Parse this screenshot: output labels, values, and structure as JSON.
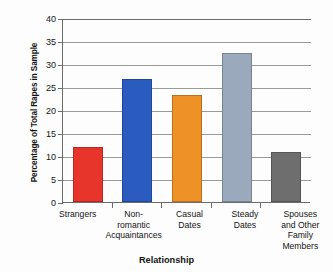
{
  "chart_data": {
    "type": "bar",
    "title": "",
    "xlabel": "Relationship",
    "ylabel": "Percentage of Total Rapes in Sample",
    "categories": [
      "Strangers",
      "Non-romantic Acquaintances",
      "Casual Dates",
      "Steady Dates",
      "Spouses and Other Family Members"
    ],
    "category_lines": [
      [
        "Strangers"
      ],
      [
        "Non-",
        "romantic",
        "Acquaintances"
      ],
      [
        "Casual",
        "Dates"
      ],
      [
        "Steady",
        "Dates"
      ],
      [
        "Spouses",
        "and Other",
        "Family",
        "Members"
      ]
    ],
    "values": [
      12.0,
      26.7,
      23.3,
      32.5,
      10.8
    ],
    "colors": [
      "#e8352c",
      "#2a5cbf",
      "#ee9126",
      "#9ba9bc",
      "#6e6e6e"
    ],
    "ylim": [
      0,
      40
    ],
    "yticks": [
      0,
      5,
      10,
      15,
      20,
      25,
      30,
      35,
      40
    ],
    "ytick_labels": [
      "0",
      "5",
      "10",
      "15",
      "20",
      "25",
      "30",
      "35",
      "40"
    ],
    "grid": true,
    "legend": "none"
  },
  "axis": {
    "y_title": "Percentage of Total Rapes in Sample",
    "x_title": "Relationship"
  }
}
